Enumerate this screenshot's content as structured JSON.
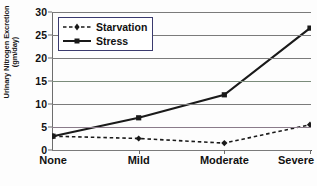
{
  "chart_data": {
    "type": "line",
    "title": "",
    "xlabel": "",
    "ylabel": "Urinary Nitrogen Excretion (gm/day)",
    "ylabel_line1": "Urinary Nitrogen Excretion",
    "ylabel_line2": "(gm/day)",
    "categories": [
      "None",
      "Mild",
      "Moderate",
      "Severe"
    ],
    "series": [
      {
        "name": "Starvation",
        "values": [
          3,
          2.5,
          1.5,
          5.5
        ],
        "style": "dashed",
        "marker": "plus",
        "color": "#1a1a1a"
      },
      {
        "name": "Stress",
        "values": [
          3,
          7,
          12,
          26.5
        ],
        "style": "solid",
        "marker": "square",
        "color": "#1a1a1a"
      }
    ],
    "ylim": [
      0,
      30
    ],
    "yticks": [
      0,
      5,
      10,
      15,
      20,
      25,
      30
    ],
    "ytick_labels": [
      "0",
      "5",
      "10",
      "15",
      "20",
      "25",
      "30"
    ],
    "grid": true,
    "grid_axis": "y",
    "legend_position": "top-left",
    "legend_entries": [
      "Starvation",
      "Stress"
    ]
  }
}
